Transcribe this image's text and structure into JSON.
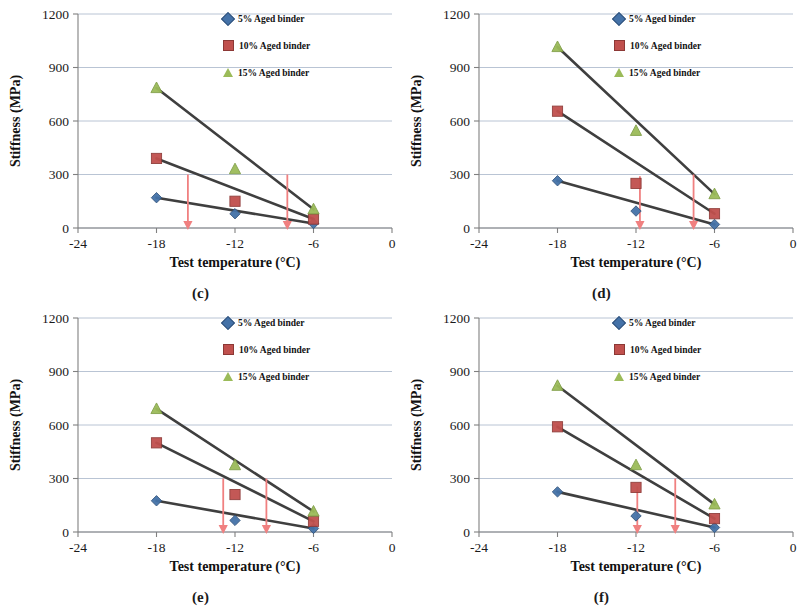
{
  "figure": {
    "background": "#ffffff",
    "panel_count": 4
  },
  "common": {
    "xlabel": "Test temperature (°C)",
    "ylabel": "Stiffness (MPa)",
    "xticks": [
      "-24",
      "-18",
      "-12",
      "-6",
      "0"
    ],
    "yticks": [
      "0",
      "300",
      "600",
      "900",
      "1200"
    ],
    "legend": [
      {
        "label": "5% Aged binder",
        "marker": "diamond-marker",
        "color": "#4472a8"
      },
      {
        "label": "10% Aged binder",
        "marker": "square-marker",
        "color": "#c0504d"
      },
      {
        "label": "15% Aged binder",
        "marker": "triangle-marker",
        "color": "#9bbb59"
      }
    ],
    "colors": {
      "series_5": "#4472a8",
      "series_10": "#c0504d",
      "series_15": "#9bbb59",
      "trendline": "#3f3f3f",
      "arrow": "#f08080",
      "gridline": "#b9c4d4",
      "axis": "#808080"
    }
  },
  "chart_data": [
    {
      "type": "scatter",
      "panel": "(c)",
      "title": "",
      "xlabel": "Test temperature (°C)",
      "ylabel": "Stiffness (MPa)",
      "xlim": [
        -24,
        0
      ],
      "ylim": [
        0,
        1200
      ],
      "xticks": [
        -24,
        -18,
        -12,
        -6,
        0
      ],
      "yticks": [
        0,
        300,
        600,
        900,
        1200
      ],
      "grid": true,
      "legend_position": "top-right",
      "x": [
        -18,
        -12,
        -6
      ],
      "series": [
        {
          "name": "5% Aged binder",
          "values": [
            170,
            80,
            25
          ]
        },
        {
          "name": "10% Aged binder",
          "values": [
            390,
            150,
            50
          ]
        },
        {
          "name": "15% Aged binder",
          "values": [
            785,
            330,
            105
          ]
        }
      ],
      "annotations": [
        {
          "type": "down-arrow",
          "x": -15.6,
          "y_from": 300,
          "y_to": 0
        },
        {
          "type": "down-arrow",
          "x": -8.0,
          "y_from": 300,
          "y_to": 0
        }
      ]
    },
    {
      "type": "scatter",
      "panel": "(d)",
      "title": "",
      "xlabel": "Test temperature (°C)",
      "ylabel": "Stiffness (MPa)",
      "xlim": [
        -24,
        0
      ],
      "ylim": [
        0,
        1200
      ],
      "xticks": [
        -24,
        -18,
        -12,
        -6,
        0
      ],
      "yticks": [
        0,
        300,
        600,
        900,
        1200
      ],
      "grid": true,
      "legend_position": "top-right",
      "x": [
        -18,
        -12,
        -6
      ],
      "series": [
        {
          "name": "5% Aged binder",
          "values": [
            265,
            95,
            20
          ]
        },
        {
          "name": "10% Aged binder",
          "values": [
            655,
            250,
            80
          ]
        },
        {
          "name": "15% Aged binder",
          "values": [
            1015,
            545,
            190
          ]
        }
      ],
      "annotations": [
        {
          "type": "down-arrow",
          "x": -11.7,
          "y_from": 290,
          "y_to": 0
        },
        {
          "type": "down-arrow",
          "x": -7.6,
          "y_from": 300,
          "y_to": 0
        }
      ]
    },
    {
      "type": "scatter",
      "panel": "(e)",
      "title": "",
      "xlabel": "Test temperature (°C)",
      "ylabel": "Stiffness (MPa)",
      "xlim": [
        -24,
        0
      ],
      "ylim": [
        0,
        1200
      ],
      "xticks": [
        -24,
        -18,
        -12,
        -6,
        0
      ],
      "yticks": [
        0,
        300,
        600,
        900,
        1200
      ],
      "grid": true,
      "legend_position": "top-right",
      "x": [
        -18,
        -12,
        -6
      ],
      "series": [
        {
          "name": "5% Aged binder",
          "values": [
            175,
            65,
            20
          ]
        },
        {
          "name": "10% Aged binder",
          "values": [
            500,
            210,
            60
          ]
        },
        {
          "name": "15% Aged binder",
          "values": [
            690,
            375,
            115
          ]
        }
      ],
      "annotations": [
        {
          "type": "down-arrow",
          "x": -12.9,
          "y_from": 300,
          "y_to": 0
        },
        {
          "type": "down-arrow",
          "x": -9.6,
          "y_from": 300,
          "y_to": 0
        }
      ]
    },
    {
      "type": "scatter",
      "panel": "(f)",
      "title": "",
      "xlabel": "Test temperature (°C)",
      "ylabel": "Stiffness (MPa)",
      "xlim": [
        -24,
        0
      ],
      "ylim": [
        0,
        1200
      ],
      "xticks": [
        -24,
        -18,
        -12,
        -6,
        0
      ],
      "yticks": [
        0,
        300,
        600,
        900,
        1200
      ],
      "grid": true,
      "legend_position": "top-right",
      "x": [
        -18,
        -12,
        -6
      ],
      "series": [
        {
          "name": "5% Aged binder",
          "values": [
            225,
            90,
            25
          ]
        },
        {
          "name": "10% Aged binder",
          "values": [
            590,
            250,
            75
          ]
        },
        {
          "name": "15% Aged binder",
          "values": [
            820,
            375,
            155
          ]
        }
      ],
      "annotations": [
        {
          "type": "down-arrow",
          "x": -11.9,
          "y_from": 255,
          "y_to": 0
        },
        {
          "type": "down-arrow",
          "x": -9.0,
          "y_from": 300,
          "y_to": 0
        }
      ]
    }
  ]
}
